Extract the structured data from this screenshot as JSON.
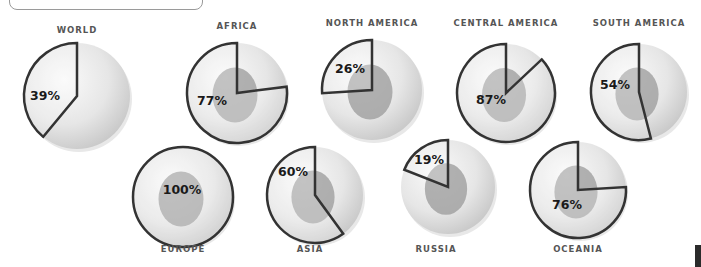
{
  "chart_data": {
    "type": "pie",
    "title": "",
    "categories": [
      "WORLD",
      "AFRICA",
      "NORTH AMERICA",
      "CENTRAL AMERICA",
      "SOUTH AMERICA",
      "EUROPE",
      "ASIA",
      "RUSSIA",
      "OCEANIA"
    ],
    "values": [
      39,
      77,
      26,
      87,
      54,
      100,
      60,
      19,
      76
    ],
    "labels": [
      "39%",
      "77%",
      "26%",
      "87%",
      "54%",
      "100%",
      "60%",
      "19%",
      "76%"
    ],
    "legend": null
  },
  "regions": [
    {
      "name": "WORLD",
      "pct": "39%",
      "value": 39,
      "cx": 77,
      "cy": 96,
      "r": 53,
      "lx": 77,
      "ly": 33,
      "px": 45,
      "py": 100,
      "land": false
    },
    {
      "name": "AFRICA",
      "pct": "77%",
      "value": 77,
      "cx": 237,
      "cy": 93,
      "r": 50,
      "lx": 237,
      "ly": 29,
      "px": 212,
      "py": 105,
      "land": true
    },
    {
      "name": "NORTH AMERICA",
      "pct": "26%",
      "value": 26,
      "cx": 372,
      "cy": 90,
      "r": 50,
      "lx": 372,
      "ly": 26,
      "px": 350,
      "py": 73,
      "land": true
    },
    {
      "name": "CENTRAL AMERICA",
      "pct": "87%",
      "value": 87,
      "cx": 506,
      "cy": 93,
      "r": 49,
      "lx": 506,
      "ly": 26,
      "px": 491,
      "py": 104,
      "land": true
    },
    {
      "name": "SOUTH AMERICA",
      "pct": "54%",
      "value": 54,
      "cx": 639,
      "cy": 92,
      "r": 48,
      "lx": 639,
      "ly": 26,
      "px": 615,
      "py": 89,
      "land": true
    },
    {
      "name": "EUROPE",
      "pct": "100%",
      "value": 100,
      "cx": 183,
      "cy": 197,
      "r": 50,
      "lx": 183,
      "ly": 252,
      "px": 182,
      "py": 194,
      "land": true
    },
    {
      "name": "ASIA",
      "pct": "60%",
      "value": 60,
      "cx": 315,
      "cy": 195,
      "r": 48,
      "lx": 310,
      "ly": 252,
      "px": 293,
      "py": 176,
      "land": true
    },
    {
      "name": "RUSSIA",
      "pct": "19%",
      "value": 19,
      "cx": 448,
      "cy": 187,
      "r": 47,
      "lx": 436,
      "ly": 252,
      "px": 429,
      "py": 164,
      "land": true
    },
    {
      "name": "OCEANIA",
      "pct": "76%",
      "value": 76,
      "cx": 578,
      "cy": 190,
      "r": 48,
      "lx": 578,
      "ly": 252,
      "px": 567,
      "py": 209,
      "land": true
    }
  ],
  "colors": {
    "globe_light": "#f2f2f2",
    "globe_dark": "#cfcfcf",
    "land": "#9a9a9a",
    "wedge_stroke": "#333333",
    "label": "#555555",
    "pct": "#1a1a1a"
  }
}
